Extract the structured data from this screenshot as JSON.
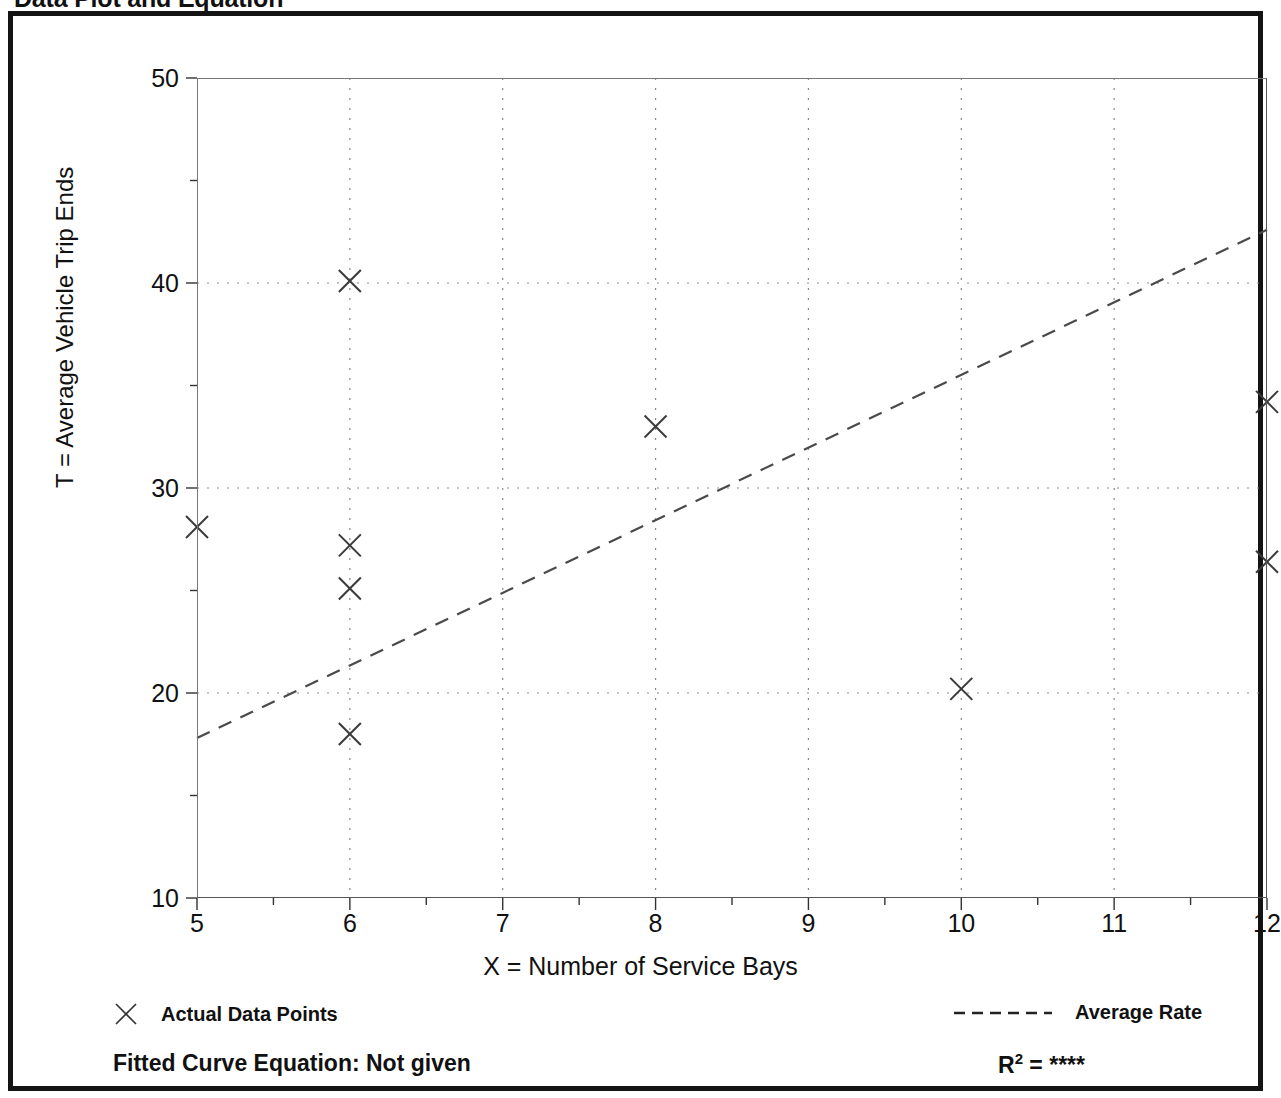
{
  "page_title": "Data Plot and Equation",
  "chart_data": {
    "type": "scatter",
    "title": "Data Plot and Equation",
    "xlabel": "X = Number of Service Bays",
    "ylabel": "T = Average Vehicle Trip Ends",
    "xlim": [
      5,
      12
    ],
    "ylim": [
      10,
      50
    ],
    "grid": true,
    "x_major_ticks": [
      5,
      6,
      7,
      8,
      9,
      10,
      11,
      12
    ],
    "x_tick_labels": [
      "5",
      "6",
      "7",
      "8",
      "9",
      "10",
      "11",
      "12"
    ],
    "x_minor_ticks": [
      5.5,
      6.5,
      7.5,
      8.5,
      9.5,
      10.5,
      11.5
    ],
    "y_major_ticks": [
      10,
      20,
      30,
      40,
      50
    ],
    "y_tick_labels": [
      "10",
      "20",
      "30",
      "40",
      "50"
    ],
    "y_minor_ticks": [
      15,
      25,
      35,
      45
    ],
    "legend_position": "below-axes",
    "series": [
      {
        "name": "Actual Data Points",
        "type": "scatter",
        "marker": "x",
        "points": [
          {
            "x": 5,
            "y": 28.1
          },
          {
            "x": 6,
            "y": 40.1
          },
          {
            "x": 6,
            "y": 27.2
          },
          {
            "x": 6,
            "y": 25.1
          },
          {
            "x": 6,
            "y": 18.0
          },
          {
            "x": 8,
            "y": 33.0
          },
          {
            "x": 10,
            "y": 20.2
          },
          {
            "x": 12,
            "y": 34.2
          },
          {
            "x": 12,
            "y": 26.4
          }
        ]
      },
      {
        "name": "Average Rate",
        "type": "line",
        "style": "dashed",
        "points": [
          {
            "x": 5,
            "y": 17.8
          },
          {
            "x": 12,
            "y": 42.6
          }
        ]
      }
    ]
  },
  "legend": {
    "actual_data_points_label": "Actual Data Points",
    "average_rate_label": "Average Rate",
    "marker_icon": "x-marker-icon",
    "line_icon": "dashed-line-icon"
  },
  "footer": {
    "equation_label": "Fitted Curve Equation:  Not given",
    "r2_symbol": "R",
    "r2_exponent": "2",
    "r2_equals": " = ",
    "r2_value": "****"
  }
}
